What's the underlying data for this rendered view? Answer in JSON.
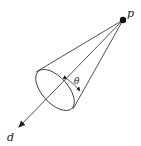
{
  "diagram": {
    "labels": {
      "apex": "p",
      "direction": "d",
      "angle": "θ"
    },
    "colors": {
      "stroke": "#222222",
      "background": "#ffffff"
    }
  }
}
